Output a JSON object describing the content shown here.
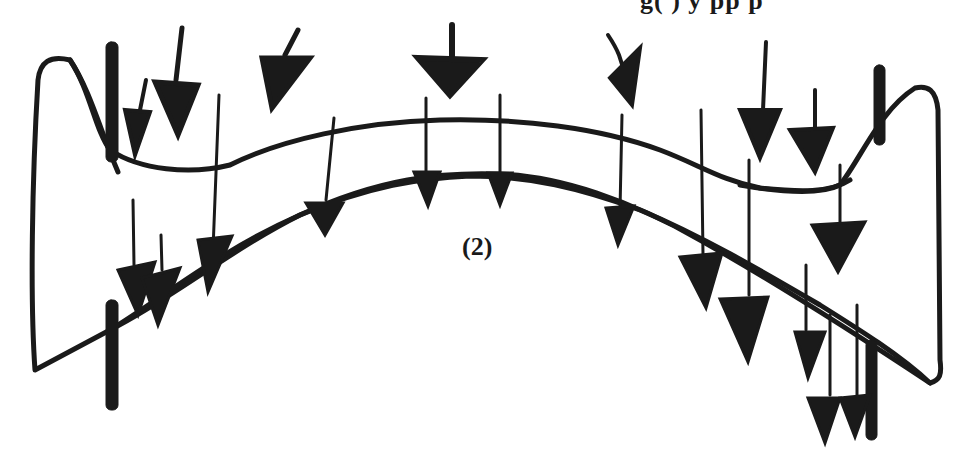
{
  "figure": {
    "label": "(2)",
    "cut_off_header_text": "g(   )    y   pp  p",
    "ink_color": "#1a1a1a",
    "background_color": "#ffffff"
  }
}
